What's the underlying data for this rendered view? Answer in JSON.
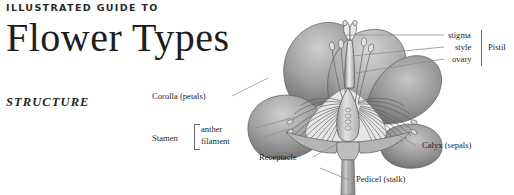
{
  "masthead": {
    "kicker": "ILLUSTRATED GUIDE TO",
    "title": "Flower Types",
    "section": "STRUCTURE"
  },
  "illustration": {
    "name": "flower-cutaway-diagram",
    "subject": "cross-section of a generic flower",
    "style": "grayscale botanical engraving",
    "colors": {
      "petal_light": "#b9b9b9",
      "petal_mid": "#8f8f8f",
      "petal_dark": "#6a6a6a",
      "stem": "#a8a8a8",
      "interior": "#d9d9d9",
      "outline": "#5a5a5a",
      "leader_line": "#8a8a8a"
    }
  },
  "labels": {
    "corolla": "Corolla (petals)",
    "stamen_group": "Stamen",
    "anther": "anther",
    "filament": "filament",
    "receptacle": "Receptacle",
    "pedicel": "Pedicel (stalk)",
    "stigma": "stigma",
    "style": "style",
    "ovary": "ovary",
    "pistil_group": "Pistil",
    "calyx": "Calyx (sepals)"
  }
}
